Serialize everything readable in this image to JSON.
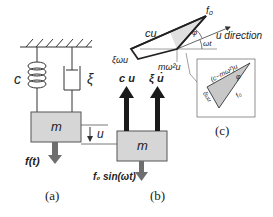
{
  "panel_a": {
    "caption": "(a)",
    "spring_label": "c",
    "damper_label": "ξ",
    "mass_label": "m",
    "force_label": "f(t)",
    "disp_label": "u"
  },
  "panel_b": {
    "caption": "(b)",
    "mass_label": "m",
    "spring_force_label": "c u",
    "damper_force_label": "ξ u̇",
    "force_label": "f₀ sin(ωt)"
  },
  "panel_c": {
    "caption": "(c)",
    "cu_label": "cu",
    "xi_label": "ξωu",
    "inertia_label": "mω²u",
    "f0_label": "f₀",
    "direction_label": "u direction",
    "phi_label": "φ",
    "wt_label": "ωt",
    "inset_top_label": "(c−mω²)u",
    "inset_left_label": "ξωu",
    "inset_f0_label": "f₀",
    "inset_phi_label": "φ"
  },
  "colors": {
    "mass_fill": "#d6d6d6",
    "arrow_dark": "#1a1a1a",
    "arrow_gray": "#6e6e6e",
    "shade": "#c8c8c8"
  }
}
